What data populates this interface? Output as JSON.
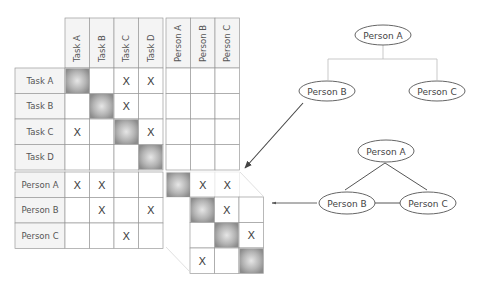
{
  "figure": {
    "matrix": {
      "task_columns": [
        "Task A",
        "Task B",
        "Task C",
        "Task D"
      ],
      "person_columns": [
        "Person A",
        "Person B",
        "Person C"
      ],
      "task_rows": [
        {
          "label": "Task A",
          "task_cells": [
            "diag",
            "",
            "X",
            "X"
          ],
          "person_cells": [
            "",
            "",
            ""
          ]
        },
        {
          "label": "Task B",
          "task_cells": [
            "",
            "diag",
            "X",
            ""
          ],
          "person_cells": [
            "",
            "",
            ""
          ]
        },
        {
          "label": "Task C",
          "task_cells": [
            "X",
            "",
            "diag",
            "X"
          ],
          "person_cells": [
            "",
            "",
            ""
          ]
        },
        {
          "label": "Task D",
          "task_cells": [
            "",
            "",
            "",
            "diag"
          ],
          "person_cells": [
            "",
            "",
            ""
          ]
        }
      ],
      "person_rows": [
        {
          "label": "Person A",
          "task_cells": [
            "X",
            "X",
            "",
            ""
          ]
        },
        {
          "label": "Person B",
          "task_cells": [
            "",
            "X",
            "",
            "X"
          ]
        },
        {
          "label": "Person C",
          "task_cells": [
            "",
            "",
            "X",
            ""
          ]
        }
      ],
      "person_person_top_row": [
        "diag",
        "X",
        "X"
      ],
      "person_person_enlarged": [
        [
          "diag",
          "X",
          ""
        ],
        [
          "",
          "diag",
          "X"
        ],
        [
          "X",
          "",
          "diag"
        ]
      ],
      "mark_symbol": "X"
    },
    "hierarchy_tree": {
      "root": "Person A",
      "children": [
        "Person B",
        "Person C"
      ]
    },
    "network_graph": {
      "nodes": [
        "Person A",
        "Person B",
        "Person C"
      ],
      "edges": [
        [
          "Person A",
          "Person B"
        ],
        [
          "Person A",
          "Person C"
        ],
        [
          "Person B",
          "Person C"
        ]
      ]
    },
    "colors": {
      "grid_line": "#9a9a9a",
      "diag_shade": "#9c9c9c",
      "label_bg": "#f4f4f4",
      "text": "#444444",
      "arrow": "#444444"
    }
  }
}
